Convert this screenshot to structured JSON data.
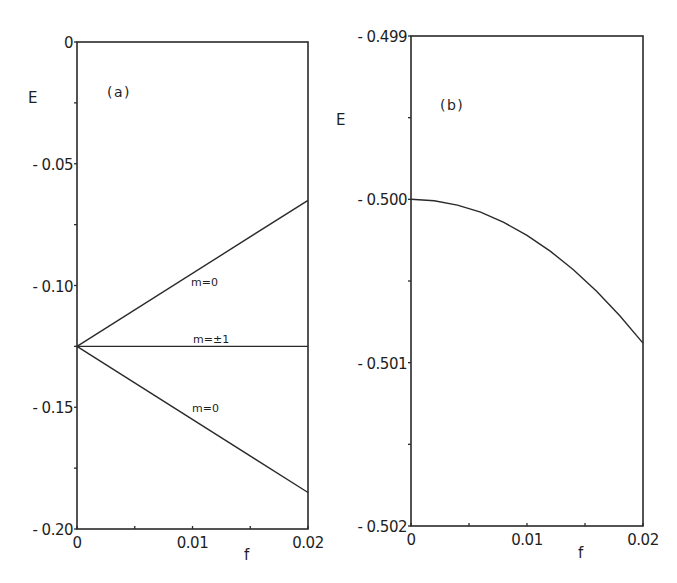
{
  "chart_data": [
    {
      "type": "line",
      "panel_label": "(a)",
      "xlabel": "f",
      "ylabel": "E",
      "xlim": [
        0,
        0.02
      ],
      "ylim": [
        -0.2,
        0
      ],
      "x_major_ticks": [
        0,
        0.01,
        0.02
      ],
      "x_tick_labels": [
        "0",
        "0.01",
        "0.02"
      ],
      "x_minor_step": 0.005,
      "y_major_ticks": [
        0,
        -0.05,
        -0.1,
        -0.15,
        -0.2
      ],
      "y_tick_labels": [
        "0",
        "- 0.05",
        "- 0.10",
        "- 0.15",
        "- 0.20"
      ],
      "y_minor_step": 0.025,
      "grid": false,
      "series": [
        {
          "name": "m=0 (upper)",
          "label": "m=0",
          "x": [
            0,
            0.02
          ],
          "y": [
            -0.125,
            -0.065
          ]
        },
        {
          "name": "m=±1",
          "label": "m=±1",
          "x": [
            0,
            0.02
          ],
          "y": [
            -0.125,
            -0.125
          ]
        },
        {
          "name": "m=0 (lower)",
          "label": "m=0",
          "x": [
            0,
            0.02
          ],
          "y": [
            -0.125,
            -0.185
          ]
        }
      ]
    },
    {
      "type": "line",
      "panel_label": "(b)",
      "xlabel": "f",
      "ylabel": "E",
      "xlim": [
        0,
        0.02
      ],
      "ylim": [
        -0.502,
        -0.499
      ],
      "x_major_ticks": [
        0,
        0.01,
        0.02
      ],
      "x_tick_labels": [
        "0",
        "0.01",
        "0.02"
      ],
      "x_minor_step": 0.005,
      "y_major_ticks": [
        -0.499,
        -0.5,
        -0.501,
        -0.502
      ],
      "y_tick_labels": [
        "- 0.499",
        "- 0.500",
        "- 0.501",
        "- 0.502"
      ],
      "y_minor_step": 0.0005,
      "grid": false,
      "series": [
        {
          "name": "ground state",
          "label": "",
          "x": [
            0,
            0.002,
            0.004,
            0.006,
            0.008,
            0.01,
            0.012,
            0.014,
            0.016,
            0.018,
            0.02
          ],
          "y": [
            -0.5,
            -0.500009,
            -0.500035,
            -0.500079,
            -0.500141,
            -0.50022,
            -0.500317,
            -0.500431,
            -0.500563,
            -0.500713,
            -0.50088
          ]
        }
      ]
    }
  ]
}
